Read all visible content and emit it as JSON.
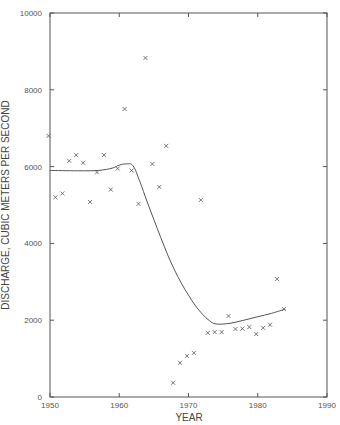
{
  "chart_data": {
    "type": "scatter",
    "title": "",
    "xlabel": "YEAR",
    "ylabel": "DISCHARGE, CUBIC METERS PER SECOND",
    "xlim": [
      1950,
      1990
    ],
    "ylim": [
      0,
      10000
    ],
    "xticks": [
      1950,
      1960,
      1970,
      1980,
      1990
    ],
    "yticks": [
      0,
      2000,
      4000,
      6000,
      8000,
      10000
    ],
    "xtick_labels": [
      "1950",
      "1960",
      "1970",
      "1980",
      "1990"
    ],
    "ytick_labels": [
      "0",
      "2000",
      "4000",
      "6000",
      "8000",
      "10000"
    ],
    "grid": false,
    "legend": null,
    "series": [
      {
        "name": "Observed annual discharge",
        "marker": "x",
        "x": [
          1950,
          1951,
          1952,
          1953,
          1954,
          1955,
          1956,
          1957,
          1958,
          1959,
          1960,
          1961,
          1962,
          1963,
          1964,
          1965,
          1966,
          1967,
          1968,
          1969,
          1970,
          1971,
          1972,
          1973,
          1974,
          1975,
          1976,
          1977,
          1978,
          1979,
          1980,
          1981,
          1982,
          1983,
          1984
        ],
        "y": [
          6800,
          5200,
          5300,
          6150,
          6300,
          6100,
          5080,
          5850,
          6300,
          5400,
          5950,
          7500,
          5900,
          5030,
          8830,
          6070,
          5470,
          6540,
          370,
          890,
          1070,
          1150,
          5130,
          1670,
          1690,
          1690,
          2110,
          1770,
          1780,
          1820,
          1640,
          1800,
          1880,
          3070,
          2290
        ]
      },
      {
        "name": "Smoothed trend",
        "marker": "line",
        "x": [
          1950,
          1954,
          1957,
          1959,
          1960,
          1961,
          1962,
          1963,
          1964,
          1965,
          1966,
          1967,
          1968,
          1969,
          1970,
          1971,
          1972,
          1973,
          1974,
          1976,
          1978,
          1980,
          1982,
          1984
        ],
        "y": [
          5900,
          5890,
          5900,
          5960,
          6040,
          6070,
          6020,
          5600,
          5100,
          4620,
          4150,
          3700,
          3300,
          2950,
          2650,
          2380,
          2160,
          1990,
          1900,
          1920,
          2000,
          2090,
          2180,
          2290
        ]
      }
    ]
  },
  "labels": {
    "x_axis_title": "YEAR",
    "y_axis_title": "DISCHARGE, CUBIC METERS PER SECOND"
  },
  "colors": {
    "axis": "#555555",
    "marker": "#555555",
    "background": "#ffffff"
  }
}
